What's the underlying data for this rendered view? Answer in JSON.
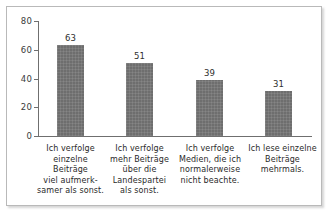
{
  "chart_data": {
    "type": "bar",
    "title": "",
    "subtitle": "",
    "xlabel": "",
    "ylabel": "",
    "ylim": [
      0,
      80
    ],
    "yticks": [
      "0",
      "20",
      "40",
      "60",
      "80"
    ],
    "grid": false,
    "legend": false,
    "bar_color": "#6e6e6e",
    "axis_color": "#6f6f6f",
    "text_color": "#2a2a2a",
    "categories": [
      "Ich verfolge\neinzelne Beiträge\nviel aufmerk-\nsamer als sonst.",
      "Ich verfolge\nmehr Beiträge\nüber die\nLandespartei\nals sonst.",
      "Ich verfolge\nMedien, die ich\nnormalerweise\nnicht beachte.",
      "Ich lese einzelne\nBeiträge\nmehrmals."
    ],
    "values": [
      63,
      51,
      39,
      31
    ],
    "value_labels": [
      "63",
      "51",
      "39",
      "31"
    ]
  }
}
